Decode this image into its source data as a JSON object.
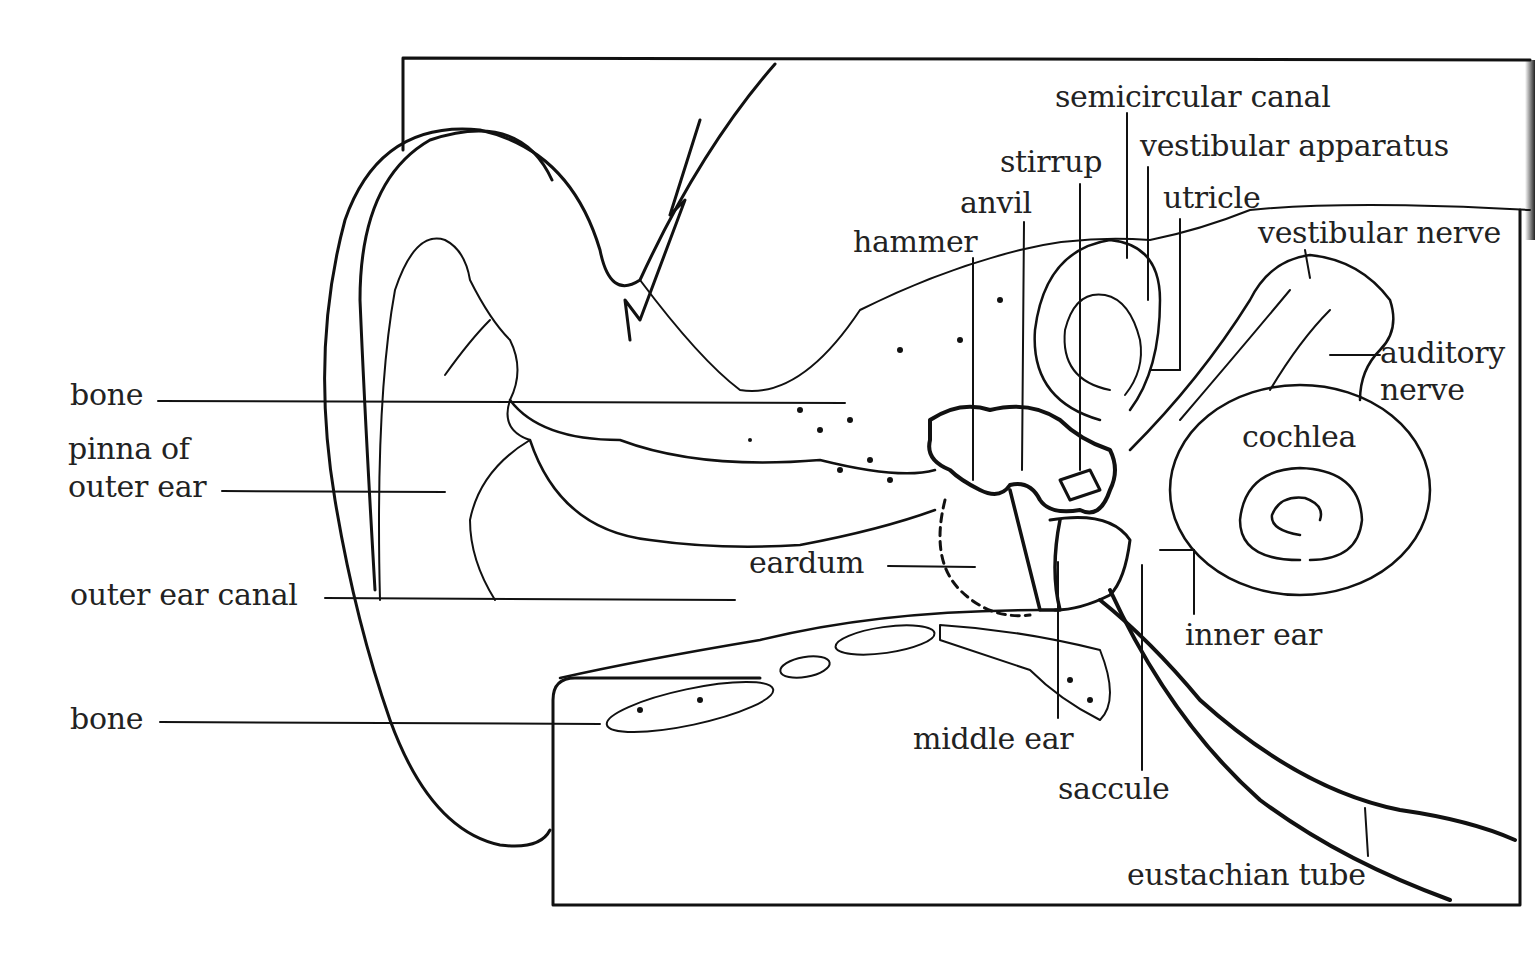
{
  "diagram": {
    "colors": {
      "line": "#111111",
      "text": "#222222",
      "background": "#ffffff"
    },
    "labels": {
      "semicircular_canal": "semicircular canal",
      "vestibular_apparatus": "vestibular apparatus",
      "stirrup": "stirrup",
      "anvil": "anvil",
      "utricle": "utricle",
      "hammer": "hammer",
      "vestibular_nerve": "vestibular nerve",
      "auditory_nerve_1": "auditory",
      "auditory_nerve_2": "nerve",
      "cochlea": "cochlea",
      "bone_upper": "bone",
      "pinna_1": "pinna of",
      "pinna_2": "outer ear",
      "outer_ear_canal": "outer ear canal",
      "eardrum": "eardum",
      "inner_ear": "inner ear",
      "bone_lower": "bone",
      "middle_ear": "middle ear",
      "saccule": "saccule",
      "eustachian_tube": "eustachian tube"
    }
  }
}
